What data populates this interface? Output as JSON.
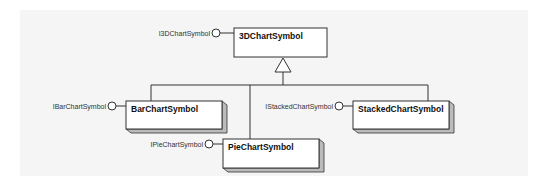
{
  "diagram": {
    "type": "UML class/interface diagram",
    "colors": {
      "line": "#333333",
      "box_fill": "#ffffff",
      "shadow": "#888888",
      "background": "#f5f5f5"
    },
    "root": {
      "class": "3DChartSymbol",
      "interface": "I3DChartSymbol"
    },
    "children": [
      {
        "class": "BarChartSymbol",
        "interface": "IBarChartSymbol"
      },
      {
        "class": "PieChartSymbol",
        "interface": "IPieChartSymbol"
      },
      {
        "class": "StackedChartSymbol",
        "interface": "IStackedChartSymbol"
      }
    ],
    "relationship": "generalization (inheritance) from children to root"
  }
}
